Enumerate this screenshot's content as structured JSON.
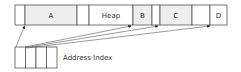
{
  "diagram": {
    "memory_bar": {
      "segments": [
        {
          "label": "",
          "x": 15,
          "w": 10,
          "shaded": false
        },
        {
          "label": "A",
          "x": 25,
          "w": 52,
          "shaded": true
        },
        {
          "label": "",
          "x": 77,
          "w": 12,
          "shaded": false
        },
        {
          "label": "Heap",
          "x": 89,
          "w": 44,
          "shaded": false
        },
        {
          "label": "B",
          "x": 133,
          "w": 19,
          "shaded": true
        },
        {
          "label": "",
          "x": 152,
          "w": 8,
          "shaded": false
        },
        {
          "label": "C",
          "x": 160,
          "w": 32,
          "shaded": true
        },
        {
          "label": "",
          "x": 192,
          "w": 18,
          "shaded": false
        },
        {
          "label": "D",
          "x": 210,
          "w": 17,
          "shaded": false
        }
      ]
    },
    "address_index": {
      "label": "Address Index",
      "cell_count": 4
    },
    "colors": {
      "stroke": "#555555",
      "shaded_fill": "#eeeeee",
      "text": "#333333"
    }
  }
}
